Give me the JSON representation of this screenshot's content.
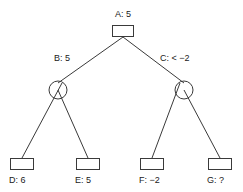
{
  "diagram": {
    "type": "game-tree",
    "title": "",
    "background_color": "#ffffff",
    "stroke_color": "#3a3a3a",
    "text_color": "#1a1a1a",
    "nodes": [
      {
        "id": "A",
        "label": "A: 5",
        "shape": "square",
        "role": "max",
        "value": "5"
      },
      {
        "id": "B",
        "label": "B: 5",
        "shape": "circle",
        "role": "min",
        "value": "5"
      },
      {
        "id": "C",
        "label": "C: < −2",
        "shape": "circle",
        "role": "min",
        "value": "< −2"
      },
      {
        "id": "D",
        "label": "D: 6",
        "shape": "square",
        "role": "leaf",
        "value": "6"
      },
      {
        "id": "E",
        "label": "E: 5",
        "shape": "square",
        "role": "leaf",
        "value": "5"
      },
      {
        "id": "F",
        "label": "F: −2",
        "shape": "square",
        "role": "leaf",
        "value": "−2"
      },
      {
        "id": "G",
        "label": "G: ?",
        "shape": "square",
        "role": "leaf",
        "value": "?"
      }
    ],
    "edges": [
      {
        "from": "A",
        "to": "B"
      },
      {
        "from": "A",
        "to": "C"
      },
      {
        "from": "B",
        "to": "D"
      },
      {
        "from": "B",
        "to": "E"
      },
      {
        "from": "C",
        "to": "F"
      },
      {
        "from": "C",
        "to": "G"
      }
    ]
  }
}
